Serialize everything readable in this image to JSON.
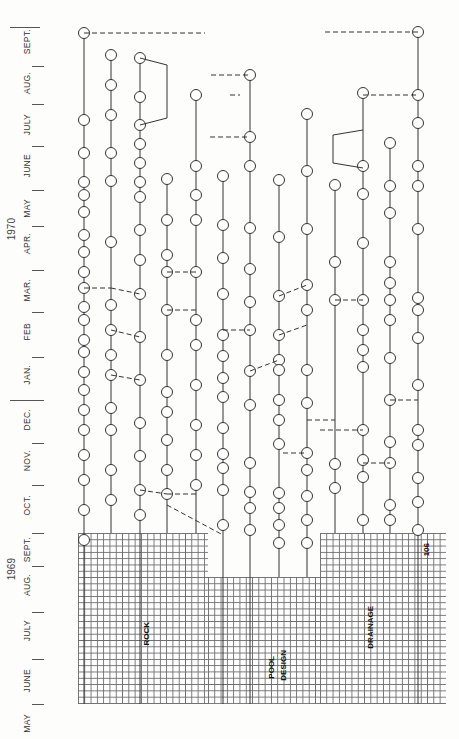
{
  "diagram": {
    "type": "rotated network schedule (CPM/PERT) on graph paper",
    "orientation": "rotated 90° counter-clockwise; time axis runs bottom-to-top",
    "years": [
      {
        "label": "1969",
        "y": 570
      },
      {
        "label": "1970",
        "y": 230
      }
    ],
    "months": [
      {
        "label": "MAY",
        "y": 724
      },
      {
        "label": "JUNE",
        "y": 682
      },
      {
        "label": "JULY",
        "y": 633
      },
      {
        "label": "AUG.",
        "y": 587
      },
      {
        "label": "SEPT.",
        "y": 553
      },
      {
        "label": "OCT.",
        "y": 508
      },
      {
        "label": "NOV.",
        "y": 463
      },
      {
        "label": "DEC.",
        "y": 422
      },
      {
        "label": "JAN.",
        "y": 378
      },
      {
        "label": "FEB",
        "y": 333
      },
      {
        "label": "MAR.",
        "y": 292
      },
      {
        "label": "APR.",
        "y": 246
      },
      {
        "label": "MAY",
        "y": 209
      },
      {
        "label": "JUNE",
        "y": 167
      },
      {
        "label": "JULY",
        "y": 127
      },
      {
        "label": "AUG.",
        "y": 85
      },
      {
        "label": "SEPT.",
        "y": 45
      }
    ],
    "month_separators_y": [
      704,
      659,
      612,
      566,
      533,
      485,
      443,
      400,
      357,
      312,
      270,
      226,
      190,
      146,
      104,
      66
    ],
    "year_separators_y": [
      27,
      400
    ],
    "grid_labels": [
      {
        "text": "ROCK",
        "x": 145,
        "y": 645
      },
      {
        "text": "POOL",
        "x": 270,
        "y": 660
      },
      {
        "text": "DESIGN",
        "x": 282,
        "y": 655
      },
      {
        "text": "DRAINAGE",
        "x": 368,
        "y": 640
      },
      {
        "text": "106",
        "x": 425,
        "y": 555
      }
    ],
    "sections": [
      "ROCK",
      "POOL DESIGN",
      "DRAINAGE"
    ],
    "page_number": "106",
    "colors": {
      "ink": "#333333",
      "grid": "#555555",
      "paper": "#fdfdfc"
    }
  }
}
